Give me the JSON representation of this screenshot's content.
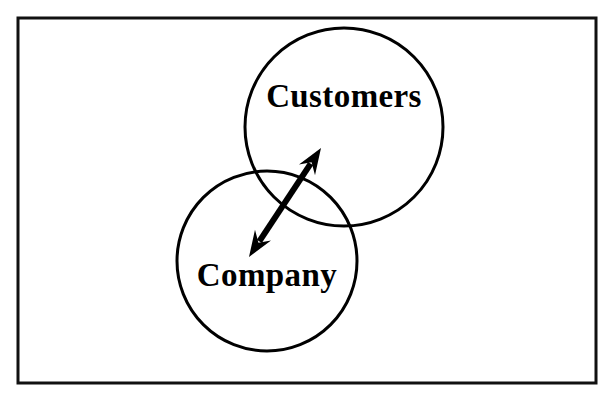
{
  "diagram": {
    "type": "venn-two-circle-with-double-arrow",
    "title": "",
    "frame": {
      "name": "outer-border",
      "x": 18,
      "y": 18,
      "width": 578,
      "height": 365,
      "stroke_color": "#111111",
      "stroke_width": 3,
      "fill_color": "#ffffff"
    },
    "background_color": "#ffffff",
    "line_color": "#000000",
    "circles": [
      {
        "id": "customers",
        "label": "Customers",
        "cx": 344,
        "cy": 127,
        "r": 99,
        "stroke_color": "#000000",
        "stroke_width": 3,
        "fill": "none",
        "label_x": 344,
        "label_y": 99
      },
      {
        "id": "company",
        "label": "Company",
        "cx": 267,
        "cy": 261,
        "r": 90,
        "stroke_color": "#000000",
        "stroke_width": 3,
        "fill": "none",
        "label_x": 267,
        "label_y": 278
      }
    ],
    "arrow": {
      "id": "relationship-arrow",
      "label": "",
      "double_headed": true,
      "from_x": 249,
      "from_y": 257,
      "to_x": 321,
      "to_y": 148,
      "stroke_color": "#000000",
      "stroke_width": 6,
      "head_length": 26,
      "head_width": 20
    }
  }
}
